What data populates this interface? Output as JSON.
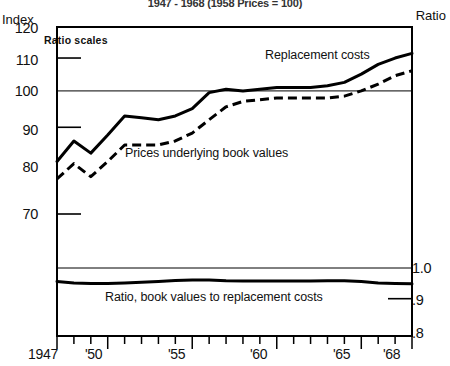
{
  "chart_title": "1947 - 1968 (1958 Prices = 100)",
  "axis": {
    "left_title": "Index",
    "right_title": "Ratio",
    "note": "Ratio scales",
    "left_ticks": [
      "120",
      "110",
      "100",
      "90",
      "80",
      "70"
    ],
    "right_ticks": [
      "1.0",
      ".9",
      ".8"
    ],
    "x_ticks": [
      "1947",
      "'50",
      "'55",
      "'60",
      "'65",
      "'68"
    ]
  },
  "series_labels": {
    "replacement": "Replacement costs",
    "prices": "Prices underlying book values",
    "ratio": "Ratio, book values to replacement costs"
  },
  "chart_data": {
    "type": "line",
    "title": "1947 - 1968 (1958 Prices = 100)",
    "xlabel": "",
    "ylabel": "Index",
    "y2label": "Ratio",
    "grid": true,
    "legend": "inline-annotations",
    "scale": "log (ratio scales)",
    "x": [
      1947,
      1948,
      1949,
      1950,
      1951,
      1952,
      1953,
      1954,
      1955,
      1956,
      1957,
      1958,
      1959,
      1960,
      1961,
      1962,
      1963,
      1964,
      1965,
      1966,
      1967,
      1968
    ],
    "upper_panel": {
      "ylim": [
        65,
        120
      ],
      "yticks": [
        70,
        80,
        90,
        100,
        110,
        120
      ],
      "series": [
        {
          "name": "Replacement costs",
          "style": "solid",
          "values": [
            81.5,
            86.5,
            83.5,
            88.0,
            93.0,
            92.5,
            92.0,
            93.0,
            95.0,
            99.5,
            100.5,
            100.0,
            100.5,
            101.0,
            101.0,
            101.0,
            101.5,
            102.5,
            105.0,
            108.0,
            110.0,
            111.5
          ]
        },
        {
          "name": "Prices underlying book values",
          "style": "dashed",
          "values": [
            77.5,
            81.0,
            78.0,
            81.5,
            85.5,
            85.5,
            85.5,
            86.5,
            88.5,
            92.0,
            95.5,
            97.0,
            97.5,
            98.0,
            98.0,
            98.0,
            98.0,
            98.5,
            100.0,
            102.0,
            104.5,
            106.0
          ]
        }
      ]
    },
    "lower_panel": {
      "ylim": [
        0.8,
        1.0
      ],
      "yticks": [
        0.8,
        0.9,
        1.0
      ],
      "series": [
        {
          "name": "Ratio, book values to replacement costs",
          "style": "solid",
          "values": [
            0.955,
            0.95,
            0.948,
            0.948,
            0.95,
            0.952,
            0.955,
            0.958,
            0.96,
            0.96,
            0.957,
            0.956,
            0.956,
            0.956,
            0.956,
            0.956,
            0.957,
            0.957,
            0.955,
            0.95,
            0.948,
            0.947
          ]
        }
      ]
    }
  }
}
